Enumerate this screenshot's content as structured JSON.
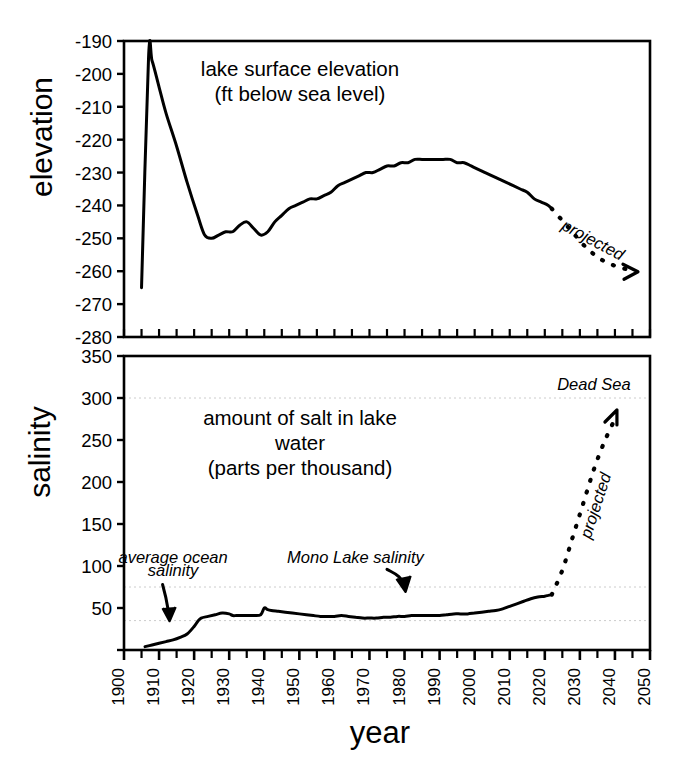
{
  "figure": {
    "width": 683,
    "height": 777,
    "xlabel": "year",
    "background": "#ffffff",
    "line_color": "#000000",
    "gridline_color": "#cccccc"
  },
  "chart_data": [
    {
      "type": "line",
      "id": "elevation",
      "title": "lake surface elevation\n(ft below sea level)",
      "title_line1": "lake surface elevation",
      "title_line2": "(ft below sea level)",
      "ylabel": "elevation",
      "xlabel": "",
      "ylim": [
        -280,
        -190
      ],
      "xlim": [
        1900,
        2050
      ],
      "yticks": [
        -190,
        -200,
        -210,
        -220,
        -230,
        -240,
        -250,
        -260,
        -270,
        -280
      ],
      "ytick_labels": [
        "-190",
        "-200",
        "-210",
        "-220",
        "-230",
        "-240",
        "-250",
        "-260",
        "-270",
        "-280"
      ],
      "xticks": [
        1900,
        1910,
        1920,
        1930,
        1940,
        1950,
        1960,
        1970,
        1980,
        1990,
        2000,
        2010,
        2020,
        2030,
        2040,
        2050
      ],
      "grid": false,
      "annotations": [
        {
          "text": "projected",
          "x": 2033,
          "y": -252,
          "style": "italic",
          "rotation": 28
        }
      ],
      "series": [
        {
          "name": "observed elevation",
          "style": "solid",
          "x": [
            1905,
            1907,
            1908,
            1910,
            1912,
            1915,
            1918,
            1921,
            1923,
            1925,
            1927,
            1929,
            1931,
            1933,
            1935,
            1937,
            1939,
            1941,
            1943,
            1945,
            1947,
            1949,
            1951,
            1953,
            1955,
            1957,
            1959,
            1961,
            1963,
            1965,
            1967,
            1969,
            1971,
            1973,
            1975,
            1977,
            1979,
            1981,
            1983,
            1985,
            1987,
            1989,
            1991,
            1993,
            1995,
            1997,
            1999,
            2001,
            2003,
            2005,
            2007,
            2009,
            2011,
            2013,
            2015,
            2017,
            2019,
            2021,
            2022
          ],
          "y": [
            -265,
            -195,
            -196,
            -204,
            -212,
            -222,
            -233,
            -243,
            -249,
            -250,
            -249,
            -248,
            -248,
            -246,
            -245,
            -247,
            -249,
            -248,
            -245,
            -243,
            -241,
            -240,
            -239,
            -238,
            -238,
            -237,
            -236,
            -234,
            -233,
            -232,
            -231,
            -230,
            -230,
            -229,
            -228,
            -228,
            -227,
            -227,
            -226,
            -226,
            -226,
            -226,
            -226,
            -226,
            -227,
            -227,
            -228,
            -229,
            -230,
            -231,
            -232,
            -233,
            -234,
            -235,
            -236,
            -238,
            -239,
            -240,
            -241
          ]
        },
        {
          "name": "projected elevation",
          "style": "dashed",
          "x": [
            2022,
            2027,
            2032,
            2037,
            2042,
            2046
          ],
          "y": [
            -241,
            -247,
            -253,
            -257,
            -259,
            -260
          ]
        }
      ]
    },
    {
      "type": "line",
      "id": "salinity",
      "title": "amount of salt in lake water\n(parts per thousand)",
      "title_line1": "amount of salt in lake",
      "title_line2": "water",
      "title_line3": "(parts per thousand)",
      "ylabel": "salinity",
      "xlabel": "year",
      "ylim": [
        0,
        350
      ],
      "xlim": [
        1900,
        2050
      ],
      "yticks": [
        0,
        50,
        100,
        150,
        200,
        250,
        300,
        350
      ],
      "ytick_labels": [
        "",
        "50",
        "100",
        "150",
        "200",
        "250",
        "300",
        "350"
      ],
      "xticks": [
        1900,
        1910,
        1920,
        1930,
        1940,
        1950,
        1960,
        1970,
        1980,
        1990,
        2000,
        2010,
        2020,
        2030,
        2040,
        2050
      ],
      "grid": true,
      "reference_lines": [
        {
          "label": "Dead Sea",
          "value": 300
        },
        {
          "label": "Mono Lake salinity",
          "value": 75
        },
        {
          "label": "average ocean salinity",
          "value": 35
        }
      ],
      "annotations": [
        {
          "text": "Dead Sea",
          "x": 2034,
          "y": 310,
          "style": "italic"
        },
        {
          "text": "Mono Lake salinity",
          "x": 1966,
          "y": 103,
          "style": "italic"
        },
        {
          "text": "average ocean",
          "x": 1914,
          "y": 103,
          "style": "italic"
        },
        {
          "text": "salinity",
          "x": 1914,
          "y": 88,
          "style": "italic"
        },
        {
          "text": "projected",
          "x": 2036,
          "y": 170,
          "style": "italic",
          "rotation": -72
        }
      ],
      "series": [
        {
          "name": "observed salinity",
          "style": "solid",
          "x": [
            1906,
            1908,
            1910,
            1912,
            1914,
            1916,
            1918,
            1920,
            1921,
            1922,
            1924,
            1926,
            1928,
            1930,
            1931,
            1932,
            1933,
            1935,
            1937,
            1939,
            1940,
            1941,
            1942,
            1944,
            1946,
            1948,
            1950,
            1952,
            1954,
            1956,
            1958,
            1960,
            1962,
            1964,
            1966,
            1968,
            1970,
            1972,
            1974,
            1976,
            1978,
            1980,
            1982,
            1984,
            1986,
            1988,
            1990,
            1992,
            1994,
            1996,
            1998,
            2000,
            2002,
            2004,
            2006,
            2008,
            2010,
            2012,
            2014,
            2016,
            2018,
            2020,
            2021,
            2022
          ],
          "y": [
            4,
            6,
            8,
            10,
            12,
            15,
            19,
            28,
            34,
            38,
            40,
            42,
            44,
            43,
            41,
            41,
            41,
            41,
            41,
            42,
            50,
            48,
            47,
            46,
            45,
            44,
            43,
            42,
            41,
            40,
            40,
            40,
            41,
            40,
            39,
            38,
            38,
            38,
            39,
            39,
            40,
            40,
            41,
            41,
            41,
            41,
            41,
            42,
            43,
            43,
            43,
            44,
            45,
            46,
            47,
            49,
            52,
            55,
            58,
            61,
            63,
            64,
            65,
            66
          ]
        },
        {
          "name": "projected salinity",
          "style": "dashed",
          "x": [
            2022,
            2025,
            2028,
            2031,
            2034,
            2037,
            2040
          ],
          "y": [
            66,
            95,
            135,
            175,
            215,
            248,
            275
          ]
        }
      ]
    }
  ],
  "axis_labels": {
    "elevation": "elevation",
    "salinity": "salinity",
    "year": "year"
  }
}
